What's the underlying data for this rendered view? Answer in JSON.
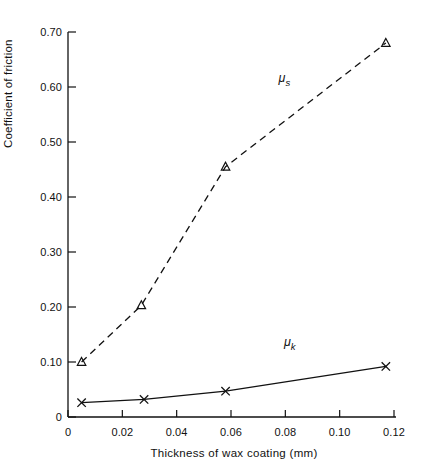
{
  "chart_data": {
    "type": "scatter",
    "title": "",
    "xlabel": "Thickness of wax coating (mm)",
    "ylabel": "Coefficient of friction",
    "xlim": [
      0,
      0.12
    ],
    "ylim": [
      0,
      0.7
    ],
    "grid": false,
    "legend_position": "inline-annotation",
    "xticks": [
      "0",
      "0.02",
      "0.04",
      "0.06",
      "0.08",
      "0.10",
      "0.12"
    ],
    "xtick_values": [
      0,
      0.02,
      0.04,
      0.06,
      0.08,
      0.1,
      0.12
    ],
    "yticks": [
      "0",
      "0.10",
      "0.20",
      "0.30",
      "0.40",
      "0.50",
      "0.60",
      "0.70"
    ],
    "ytick_values": [
      0,
      0.1,
      0.2,
      0.3,
      0.4,
      0.5,
      0.6,
      0.7
    ],
    "series": [
      {
        "name": "mu_s",
        "label": "μ",
        "label_sub": "s",
        "marker": "triangle",
        "line_style": "dashed",
        "color": "#111111",
        "annotation_x": 0.0775,
        "annotation_y": 0.615,
        "x": [
          0.005,
          0.027,
          0.058,
          0.117
        ],
        "values": [
          0.1,
          0.203,
          0.455,
          0.68
        ]
      },
      {
        "name": "mu_k",
        "label": "μ",
        "label_sub": "k",
        "marker": "x",
        "line_style": "solid",
        "color": "#111111",
        "annotation_x": 0.0795,
        "annotation_y": 0.135,
        "x": [
          0.005,
          0.028,
          0.058,
          0.117
        ],
        "values": [
          0.026,
          0.032,
          0.047,
          0.092
        ]
      }
    ]
  }
}
